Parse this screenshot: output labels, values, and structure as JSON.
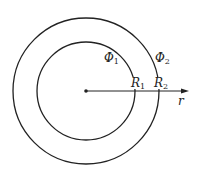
{
  "diagram": {
    "type": "concentric-circles",
    "center": {
      "x": 86,
      "y": 91
    },
    "circles": [
      {
        "name": "inner",
        "radius": 49,
        "potential_label": "Φ",
        "potential_sub": "1",
        "radius_label": "R",
        "radius_sub": "1"
      },
      {
        "name": "outer",
        "radius": 73,
        "potential_label": "Φ",
        "potential_sub": "2",
        "radius_label": "R",
        "radius_sub": "2"
      }
    ],
    "axis": {
      "label": "r"
    },
    "colors": {
      "stroke": "#222222",
      "background": "#ffffff"
    }
  }
}
